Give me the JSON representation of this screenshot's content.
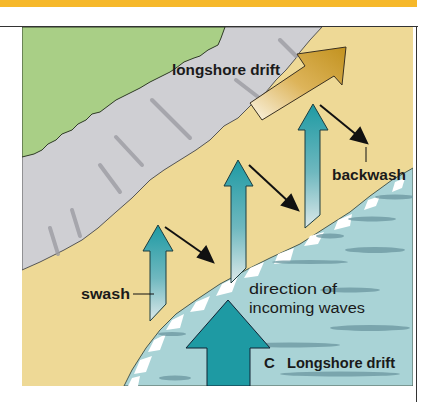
{
  "figure": {
    "caption_label": "C",
    "caption_title": "Longshore drift"
  },
  "labels": {
    "longshore_drift": "longshore drift",
    "backwash": "backwash",
    "swash": "swash",
    "incoming_line1": "direction of",
    "incoming_line2": "incoming waves"
  },
  "colors": {
    "header_band": "#f6b82a",
    "grass": "#a9cf86",
    "cliff": "#cfcfd3",
    "beach": "#eed996",
    "sea": "#a9d3d6",
    "swash_arrow": "#1e9aa3",
    "drift_arrow": "#c99a2a",
    "incoming_arrow": "#1e9aa3"
  }
}
